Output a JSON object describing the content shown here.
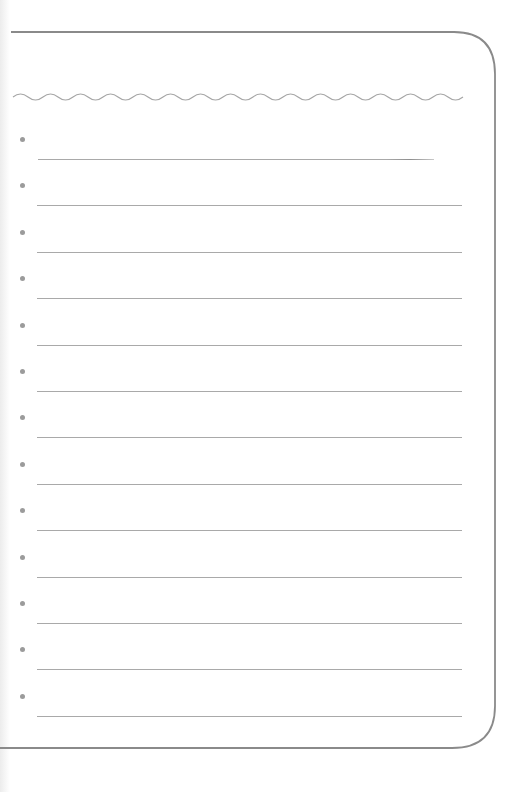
{
  "page": {
    "type": "blank lined list sheet",
    "background_color": "#ffffff",
    "border_color": "#8a8a8a",
    "wave_color": "#a6a6a6",
    "bullet_color": "#9b9b9b",
    "rule_color": "#a9a9a9"
  },
  "list": {
    "item_count": 13,
    "items": [
      {
        "text": ""
      },
      {
        "text": ""
      },
      {
        "text": ""
      },
      {
        "text": ""
      },
      {
        "text": ""
      },
      {
        "text": ""
      },
      {
        "text": ""
      },
      {
        "text": ""
      },
      {
        "text": ""
      },
      {
        "text": ""
      },
      {
        "text": ""
      },
      {
        "text": ""
      },
      {
        "text": ""
      }
    ]
  }
}
